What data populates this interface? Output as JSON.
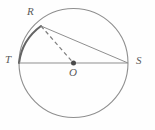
{
  "figure": {
    "kind": "circle-geometry-diagram",
    "canvas": {
      "width": 155,
      "height": 130
    },
    "background_color": "#fefefe",
    "stroke_color": "#8a8a8a",
    "emphasis_stroke_color": "#5f5f5f",
    "label_color": "#5a5a5a",
    "circle": {
      "center": {
        "x": 73.5,
        "y": 63
      },
      "radius": 54.5,
      "stroke_width": 1.1
    },
    "points": [
      {
        "name": "R",
        "label": "R",
        "x": 41,
        "y": 26,
        "on_circle": true
      },
      {
        "name": "T",
        "label": "T",
        "x": 19,
        "y": 63,
        "on_circle": true
      },
      {
        "name": "O",
        "label": "O",
        "x": 73.5,
        "y": 63,
        "on_circle": false,
        "is_center": true
      },
      {
        "name": "S",
        "label": "S",
        "x": 128,
        "y": 63,
        "on_circle": true
      }
    ],
    "center_dot": {
      "x": 73.5,
      "y": 63,
      "radius": 2.4,
      "fill": "#4a4a4a"
    },
    "segments": [
      {
        "name": "diameter-TS",
        "from": "T",
        "to": "S",
        "style": "solid",
        "stroke_width": 1.0
      },
      {
        "name": "chord-RS",
        "from": "R",
        "to": "S",
        "style": "solid",
        "stroke_width": 1.0
      },
      {
        "name": "radius-RO",
        "from": "R",
        "to": "O",
        "style": "dashed",
        "stroke_width": 1.1,
        "dash_pattern": "4,3"
      }
    ],
    "highlighted_arc": {
      "name": "arc-TR",
      "from": "T",
      "to": "R",
      "stroke_width": 2.0,
      "description": "minor arc from T to R drawn darker and thicker"
    },
    "labels": {
      "R": "R",
      "T": "T",
      "O": "O",
      "S": "S"
    }
  }
}
